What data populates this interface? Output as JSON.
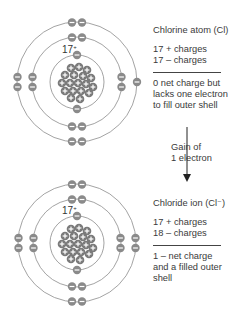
{
  "atom_top": {
    "label": "Chlorine atom (Cl)",
    "charges": [
      "17 + charges",
      "17 – charges"
    ],
    "description": [
      "0 net charge but",
      "lacks one electron",
      "to fill outer shell"
    ],
    "nucleus_label": "17+",
    "shells": [
      2,
      8,
      7
    ]
  },
  "transition": {
    "label": [
      "Gain of",
      "1 electron"
    ]
  },
  "atom_bottom": {
    "label": "Chloride ion (Cl⁻)",
    "charges": [
      "17 + charges",
      "18 – charges"
    ],
    "description": [
      "1 – net charge",
      "and a filled outer",
      "shell"
    ],
    "nucleus_label": "17+",
    "shells": [
      2,
      8,
      8
    ]
  },
  "colors": {
    "electron": "#8a8a8a",
    "proton": "#7a7a7a",
    "orbit": "#8c8c8c",
    "text": "#3a3a3a"
  }
}
